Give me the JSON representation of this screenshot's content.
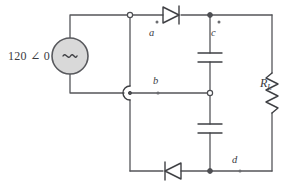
{
  "diagram": {
    "type": "electrical-circuit-schematic"
  },
  "source": {
    "label": "120 ∠ 0",
    "symbol": "~",
    "name": "ac-voltage-source",
    "fill_color": "#d9d9d9",
    "stroke_color": "#58595d"
  },
  "nodes": [
    {
      "id": "a",
      "label": "a",
      "style": "open"
    },
    {
      "id": "b",
      "label": "b",
      "style": "solid"
    },
    {
      "id": "c",
      "label": "c",
      "style": "dot"
    },
    {
      "id": "d",
      "label": "d",
      "style": "dot"
    }
  ],
  "components": {
    "diode_top": {
      "name": "diode-top",
      "direction": "right"
    },
    "diode_bottom": {
      "name": "diode-bottom",
      "direction": "left"
    },
    "capacitor_top": {
      "name": "capacitor-top"
    },
    "capacitor_bottom": {
      "name": "capacitor-bottom"
    },
    "resistor": {
      "name": "load-resistor",
      "label_main": "R",
      "label_sub": "L"
    },
    "wire_hop": {
      "name": "wire-crossing-hop"
    }
  },
  "colors": {
    "wire": "#55565a",
    "component": "#3f4044",
    "background": "#ffffff",
    "text": "#3a3b3f"
  }
}
